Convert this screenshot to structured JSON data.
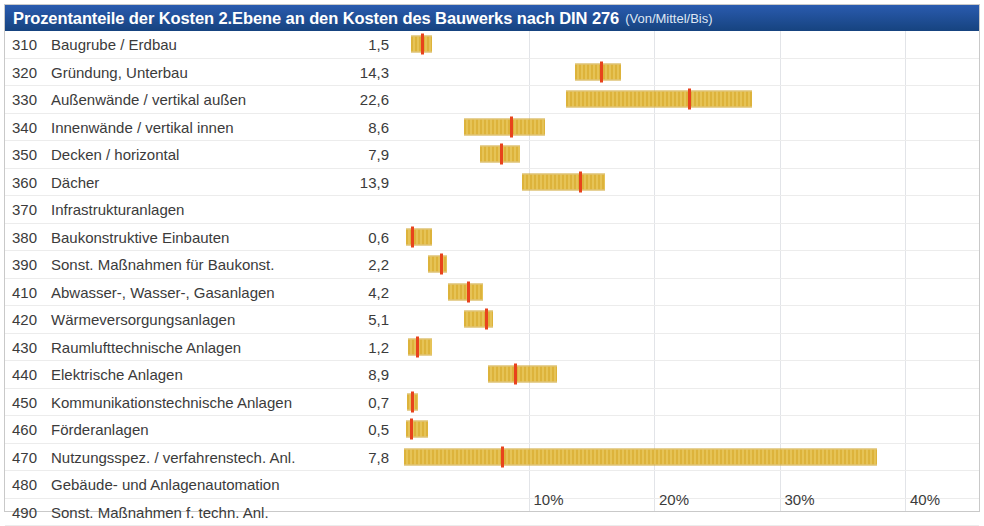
{
  "title": {
    "main": "Prozentanteile der Kosten 2.Ebene an den Kosten des Bauwerks nach DIN 276",
    "sub": "(Von/Mittel/Bis)"
  },
  "colors": {
    "title_bar": "#1f4e9c",
    "bar_fill": "#e0b73c",
    "marker": "#e8431c",
    "gridline": "#e2e4e8",
    "text": "#3b3b3b"
  },
  "chart_data": {
    "type": "bar",
    "title": "Prozentanteile der Kosten 2.Ebene an den Kosten des Bauwerks nach DIN 276",
    "subtitle": "(Von/Mittel/Bis)",
    "xlabel": "",
    "ylabel": "",
    "xlim": [
      0,
      46
    ],
    "grid": true,
    "legend": "none",
    "note": "Each row shows a floating range bar from 'Von' (low) to 'Bis' (high) with a red tick at the 'Mittel' (mean) value. The printed number column is the Mittel value.",
    "xticks": [
      10,
      20,
      30,
      40
    ],
    "xticklabels": [
      "10%",
      "20%",
      "30%",
      "40%"
    ],
    "categories": [
      "310 Baugrube / Erdbau",
      "320 Gründung, Unterbau",
      "330 Außenwände / vertikal außen",
      "340 Innenwände / vertikal innen",
      "350 Decken / horizontal",
      "360 Dächer",
      "370 Infrastrukturanlagen",
      "380 Baukonstruktive Einbauten",
      "390 Sonst. Maßnahmen für Baukonst.",
      "410 Abwasser-, Wasser-, Gasanlagen",
      "420 Wärmeversorgungsanlagen",
      "430 Raumlufttechnische Anlagen",
      "440 Elektrische Anlagen",
      "450 Kommunikationstechnische Anlagen",
      "460 Förderanlagen",
      "470 Nutzungsspez. / verfahrenstech. Anl.",
      "480 Gebäude- und Anlagenautomation",
      "490 Sonst. Maßnahmen f. techn. Anl."
    ],
    "values": [
      1.5,
      14.3,
      22.6,
      8.6,
      7.9,
      13.9,
      null,
      0.6,
      2.2,
      4.2,
      5.1,
      1.2,
      8.9,
      0.7,
      0.5,
      7.8,
      null,
      null
    ]
  },
  "rows": [
    {
      "num": "310",
      "label": "Baugrube / Erdbau",
      "value": "1,5",
      "von": 0.6,
      "mittel": 1.5,
      "bis": 2.3
    },
    {
      "num": "320",
      "label": "Gründung, Unterbau",
      "value": "14,3",
      "von": 13.7,
      "mittel": 15.8,
      "bis": 17.4
    },
    {
      "num": "330",
      "label": "Außenwände / vertikal außen",
      "value": "22,6",
      "von": 13.0,
      "mittel": 22.8,
      "bis": 27.8
    },
    {
      "num": "340",
      "label": "Innenwände / vertikal innen",
      "value": "8,6",
      "von": 4.9,
      "mittel": 8.6,
      "bis": 11.3
    },
    {
      "num": "350",
      "label": "Decken / horizontal",
      "value": "7,9",
      "von": 6.1,
      "mittel": 7.8,
      "bis": 9.3
    },
    {
      "num": "360",
      "label": "Dächer",
      "value": "13,9",
      "von": 9.5,
      "mittel": 14.1,
      "bis": 16.1
    },
    {
      "num": "370",
      "label": "Infrastrukturanlagen",
      "value": "",
      "von": null,
      "mittel": null,
      "bis": null
    },
    {
      "num": "380",
      "label": "Baukonstruktive Einbauten",
      "value": "0,6",
      "von": 0.2,
      "mittel": 0.7,
      "bis": 2.3
    },
    {
      "num": "390",
      "label": "Sonst. Maßnahmen für Baukonst.",
      "value": "2,2",
      "von": 2.0,
      "mittel": 3.0,
      "bis": 3.5
    },
    {
      "num": "410",
      "label": "Abwasser-, Wasser-, Gasanlagen",
      "value": "4,2",
      "von": 3.6,
      "mittel": 5.2,
      "bis": 6.4
    },
    {
      "num": "420",
      "label": "Wärmeversorgungsanlagen",
      "value": "5,1",
      "von": 4.9,
      "mittel": 6.6,
      "bis": 7.2
    },
    {
      "num": "430",
      "label": "Raumlufttechnische Anlagen",
      "value": "1,2",
      "von": 0.4,
      "mittel": 1.1,
      "bis": 2.3
    },
    {
      "num": "440",
      "label": "Elektrische Anlagen",
      "value": "8,9",
      "von": 6.8,
      "mittel": 8.9,
      "bis": 12.3
    },
    {
      "num": "450",
      "label": "Kommunikationstechnische Anlagen",
      "value": "0,7",
      "von": 0.3,
      "mittel": 0.7,
      "bis": 1.2
    },
    {
      "num": "460",
      "label": "Förderanlagen",
      "value": "0,5",
      "von": 0.2,
      "mittel": 0.6,
      "bis": 2.0
    },
    {
      "num": "470",
      "label": "Nutzungsspez. / verfahrenstech. Anl.",
      "value": "7,8",
      "von": 0.1,
      "mittel": 7.9,
      "bis": 37.8
    },
    {
      "num": "480",
      "label": "Gebäude- und Anlagenautomation",
      "value": "",
      "von": null,
      "mittel": null,
      "bis": null
    },
    {
      "num": "490",
      "label": "Sonst. Maßnahmen f. techn. Anl.",
      "value": "",
      "von": null,
      "mittel": null,
      "bis": null
    }
  ],
  "axis": {
    "ticks": [
      {
        "label": "10%",
        "value": 10
      },
      {
        "label": "20%",
        "value": 20
      },
      {
        "label": "30%",
        "value": 30
      },
      {
        "label": "40%",
        "value": 40
      }
    ]
  }
}
